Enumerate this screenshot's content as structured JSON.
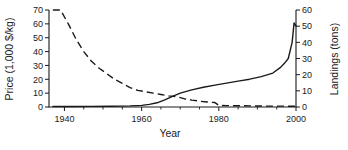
{
  "chart_data": {
    "type": "line",
    "title": "",
    "xlabel": "Year",
    "xlim": [
      1936,
      2000
    ],
    "xticks": [
      1940,
      1960,
      1980,
      2000
    ],
    "xticklabels": [
      "1940",
      "1960",
      "1980",
      "2000"
    ],
    "xminorticks": [
      1945,
      1950,
      1955,
      1965,
      1970,
      1975,
      1985,
      1990,
      1995
    ],
    "grid": false,
    "legend": "none",
    "axes": [
      {
        "id": "left",
        "ylabel": "Price (1,000 $/kg)",
        "ylim": [
          0,
          70
        ],
        "yticks": [
          0,
          10,
          20,
          30,
          40,
          50,
          60,
          70
        ],
        "yticklabels": [
          "0",
          "10",
          "20",
          "30",
          "40",
          "50",
          "60",
          "70"
        ]
      },
      {
        "id": "right",
        "ylabel": "Landings (tons)",
        "ylim": [
          0,
          60
        ],
        "yticks": [
          0,
          10,
          20,
          30,
          40,
          50,
          60
        ],
        "yticklabels": [
          "0",
          "10",
          "20",
          "30",
          "40",
          "50",
          "60"
        ]
      }
    ],
    "series": [
      {
        "name": "Price",
        "axis": "left",
        "style": "dashed",
        "unit": "1,000 $/kg",
        "x": [
          1937,
          1939,
          1941,
          1943,
          1945,
          1947,
          1949,
          1951,
          1953,
          1955,
          1957,
          1959,
          1961,
          1963,
          1965,
          1967,
          1969,
          1971,
          1973,
          1975,
          1977,
          1979,
          1980,
          1982,
          1985,
          1988,
          1991,
          1994,
          1997,
          2000
        ],
        "values": [
          70,
          70,
          60,
          49,
          40,
          33,
          28,
          24,
          20,
          17,
          14,
          12,
          11,
          10,
          9,
          8,
          7.5,
          6,
          5,
          4.2,
          3.6,
          3.2,
          1.2,
          1.0,
          0.9,
          0.8,
          0.7,
          0.6,
          0.6,
          0.5
        ]
      },
      {
        "name": "Landings",
        "axis": "right",
        "style": "solid",
        "unit": "tons",
        "x": [
          1937,
          1942,
          1947,
          1952,
          1957,
          1960,
          1962,
          1964,
          1966,
          1968,
          1970,
          1973,
          1976,
          1979,
          1982,
          1985,
          1988,
          1991,
          1994,
          1996,
          1997,
          1998,
          1999,
          1999.5,
          2000
        ],
        "values": [
          0.3,
          0.3,
          0.4,
          0.5,
          0.7,
          1.0,
          1.6,
          2.6,
          4.4,
          6.6,
          8.6,
          10.6,
          12.2,
          13.5,
          14.8,
          16.0,
          17.2,
          18.8,
          21.0,
          24.5,
          27.0,
          30.0,
          40.0,
          52.0,
          50.0
        ]
      }
    ],
    "annotations": []
  }
}
